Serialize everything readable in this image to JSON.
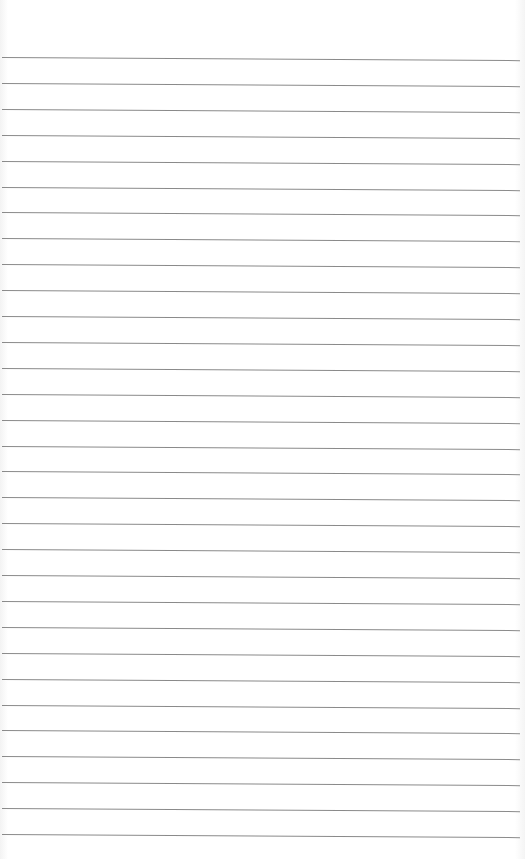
{
  "paper": {
    "type": "ruled-lined-paper",
    "line_count": 31,
    "first_line_y": 57,
    "line_spacing_px": 25.9,
    "line_color": "#8a8a8a",
    "background_color": "#ffffff"
  }
}
